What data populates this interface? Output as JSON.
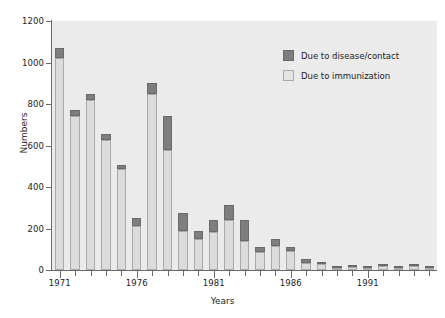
{
  "chart_data": {
    "type": "bar",
    "subtype": "stacked-vertical",
    "title": "",
    "xlabel": "Years",
    "ylabel": "Numbers",
    "ylim": [
      0,
      1200
    ],
    "yticks": [
      0,
      200,
      400,
      600,
      800,
      1000,
      1200
    ],
    "ytick_labels": [
      "0",
      "200",
      "400",
      "600",
      "800",
      "1000",
      "1200"
    ],
    "xlim": [
      1970.5,
      1995.5
    ],
    "xtick_labels": [
      "1971",
      "1976",
      "1981",
      "1986",
      "1991"
    ],
    "xticks": [
      1971,
      1976,
      1981,
      1986,
      1991
    ],
    "grid": false,
    "legend_position": "upper right",
    "categories": [
      "1971",
      "1972",
      "1973",
      "1974",
      "1975",
      "1976",
      "1977",
      "1978",
      "1979",
      "1980",
      "1981",
      "1982",
      "1983",
      "1984",
      "1985",
      "1986",
      "1987",
      "1988",
      "1989",
      "1990",
      "1991",
      "1992",
      "1993",
      "1994",
      "1995"
    ],
    "series": [
      {
        "name": "Due to immunization",
        "color": "#dcdcdc",
        "values": [
          1020,
          740,
          820,
          625,
          485,
          210,
          850,
          580,
          190,
          150,
          185,
          240,
          140,
          85,
          115,
          90,
          35,
          28,
          8,
          15,
          10,
          20,
          8,
          20,
          8
        ]
      },
      {
        "name": "Due to disease/contact",
        "color": "#7e7e7e",
        "values": [
          50,
          30,
          30,
          30,
          20,
          40,
          50,
          160,
          85,
          40,
          55,
          75,
          100,
          25,
          35,
          20,
          20,
          8,
          8,
          10,
          5,
          5,
          7,
          5,
          5
        ]
      }
    ],
    "totals": [
      1070,
      770,
      850,
      655,
      505,
      250,
      900,
      740,
      275,
      190,
      240,
      315,
      240,
      110,
      150,
      110,
      55,
      36,
      16,
      25,
      15,
      25,
      15,
      25,
      13
    ]
  },
  "legend": {
    "items": [
      {
        "label": "Due to disease/contact",
        "swatch": "dark-gray-swatch"
      },
      {
        "label": "Due to immunization",
        "swatch": "light-gray-swatch"
      }
    ]
  },
  "axes": {
    "y_title": "Numbers",
    "x_title": "Years"
  },
  "colors": {
    "immunization": "#dcdcdc",
    "disease": "#7e7e7e",
    "plot_background": "#ebebeb",
    "axis": "#6a6a6a",
    "text": "#1c1c1c",
    "page_background": "#ffffff"
  }
}
